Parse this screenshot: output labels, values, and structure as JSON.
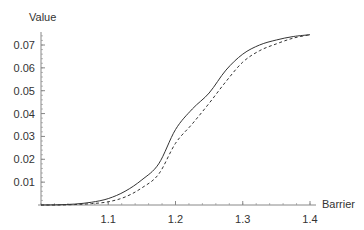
{
  "chart_data": {
    "type": "line",
    "title": "",
    "xlabel": "Barrier",
    "ylabel": "Value",
    "xlim": [
      1.0,
      1.4
    ],
    "ylim": [
      0,
      0.0755
    ],
    "grid": false,
    "legend": null,
    "x_ticks": [
      1.1,
      1.2,
      1.3,
      1.4
    ],
    "x_tick_labels": [
      "1.1",
      "1.2",
      "1.3",
      "1.4"
    ],
    "x_minor_step": 0.02,
    "y_ticks": [
      0.01,
      0.02,
      0.03,
      0.04,
      0.05,
      0.06,
      0.07
    ],
    "y_tick_labels": [
      "0.01",
      "0.02",
      "0.03",
      "0.04",
      "0.05",
      "0.06",
      "0.07"
    ],
    "y_minor_step": 0.002,
    "x": [
      1.0,
      1.025,
      1.05,
      1.075,
      1.1,
      1.125,
      1.15,
      1.175,
      1.2,
      1.225,
      1.25,
      1.275,
      1.3,
      1.325,
      1.35,
      1.375,
      1.4
    ],
    "series": [
      {
        "name": "solid",
        "style": "solid",
        "color": "#333333",
        "values": [
          0.0,
          0.0001,
          0.0004,
          0.0012,
          0.0028,
          0.006,
          0.011,
          0.018,
          0.033,
          0.042,
          0.049,
          0.059,
          0.066,
          0.07,
          0.0722,
          0.0737,
          0.0745
        ]
      },
      {
        "name": "dashed",
        "style": "dashed",
        "color": "#333333",
        "values": [
          0.0,
          0.0,
          0.0002,
          0.0006,
          0.0014,
          0.0035,
          0.0075,
          0.0135,
          0.027,
          0.0355,
          0.0445,
          0.054,
          0.0625,
          0.0675,
          0.0705,
          0.073,
          0.0745
        ]
      }
    ]
  },
  "layout": {
    "plot_left": 41,
    "plot_right": 310,
    "plot_top": 32,
    "plot_bottom": 205,
    "y_axis_top": 32,
    "x_axis_right": 316
  }
}
